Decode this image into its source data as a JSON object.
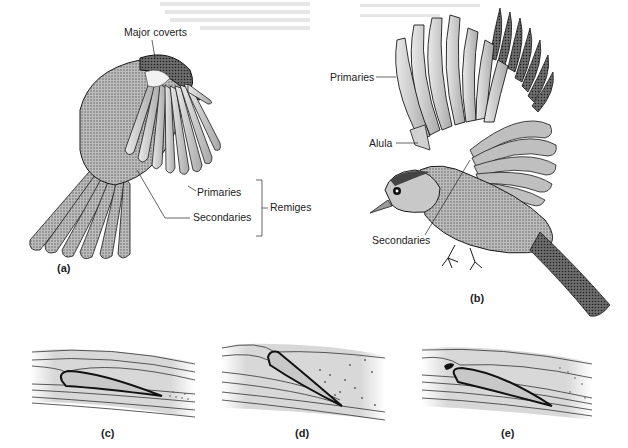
{
  "figure": {
    "panels": [
      {
        "id": "a",
        "caption": "(a)",
        "labels": [
          "Major coverts",
          "Primaries",
          "Secondaries",
          "Remiges"
        ]
      },
      {
        "id": "b",
        "caption": "(b)",
        "labels": [
          "Primaries",
          "Alula",
          "Secondaries"
        ]
      },
      {
        "id": "c",
        "caption": "(c)"
      },
      {
        "id": "d",
        "caption": "(d)"
      },
      {
        "id": "e",
        "caption": "(e)"
      }
    ]
  },
  "a": {
    "major_coverts": "Major coverts",
    "primaries": "Primaries",
    "secondaries": "Secondaries",
    "remiges": "Remiges",
    "caption": "(a)"
  },
  "b": {
    "primaries": "Primaries",
    "alula": "Alula",
    "secondaries": "Secondaries",
    "caption": "(b)"
  },
  "c": {
    "caption": "(c)"
  },
  "d": {
    "caption": "(d)"
  },
  "e": {
    "caption": "(e)"
  },
  "colors": {
    "ink": "#1a1a1a",
    "feather_light": "#d4d4d4",
    "feather_mid": "#9a9a9a",
    "feather_dark": "#4a4a4a",
    "airflow_bg": "#dcdcdc"
  }
}
